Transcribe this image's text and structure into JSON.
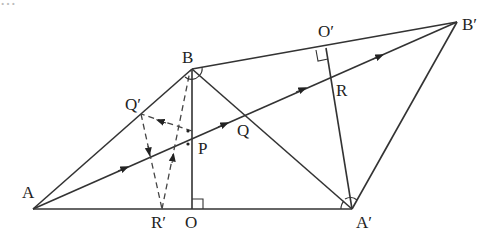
{
  "figure": {
    "type": "geometry-diagram",
    "points": [
      {
        "id": "A",
        "label": "A"
      },
      {
        "id": "B",
        "label": "B"
      },
      {
        "id": "O",
        "label": "O"
      },
      {
        "id": "P",
        "label": "P"
      },
      {
        "id": "Q",
        "label": "Q"
      },
      {
        "id": "R",
        "label": "R"
      },
      {
        "id": "A2",
        "label": "A′"
      },
      {
        "id": "B2",
        "label": "B′"
      },
      {
        "id": "O2",
        "label": "O′"
      },
      {
        "id": "Q2",
        "label": "Q′"
      },
      {
        "id": "R2",
        "label": "R′"
      }
    ],
    "solid_segments": [
      [
        "A",
        "B"
      ],
      [
        "A",
        "A2"
      ],
      [
        "B",
        "O"
      ],
      [
        "B",
        "B2"
      ],
      [
        "B",
        "A2"
      ],
      [
        "A2",
        "B2"
      ],
      [
        "A2",
        "O2"
      ],
      [
        "A",
        "B2"
      ]
    ],
    "dashed_segments": [
      [
        "P",
        "Q2"
      ],
      [
        "Q2",
        "R2"
      ],
      [
        "R2",
        "B"
      ]
    ],
    "right_angles": [
      "O",
      "O2"
    ],
    "angle_marks": [
      "B",
      "A2"
    ],
    "equal_angle_dots_at": "P",
    "arrows_on": [
      "A-P",
      "P-Q",
      "Q-R",
      "R-B2",
      "P-Q2",
      "Q2-R2",
      "R2-B"
    ]
  },
  "top_text_partial": "…"
}
